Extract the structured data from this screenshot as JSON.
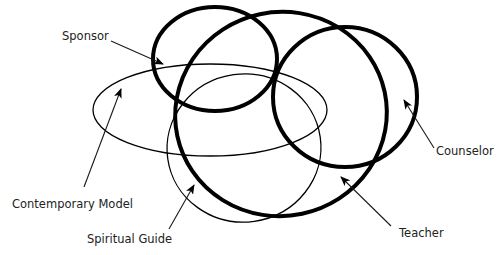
{
  "diagram": {
    "colors": {
      "stroke": "#000000",
      "text": "#222222",
      "background": "#ffffff"
    },
    "roles": [
      {
        "id": "sponsor",
        "label": "Sponsor",
        "emphasis": "thick"
      },
      {
        "id": "teacher",
        "label": "Teacher",
        "emphasis": "thick"
      },
      {
        "id": "counselor",
        "label": "Counselor",
        "emphasis": "thick"
      },
      {
        "id": "contemporary-model",
        "label": "Contemporary Model",
        "emphasis": "thin"
      },
      {
        "id": "spiritual-guide",
        "label": "Spiritual Guide",
        "emphasis": "thin"
      }
    ]
  }
}
